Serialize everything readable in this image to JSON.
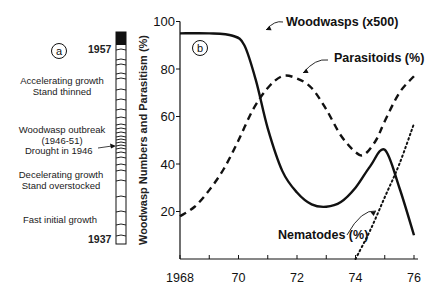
{
  "panel_a": {
    "label": "a",
    "top_year": "1957",
    "bottom_year": "1937",
    "annotations": [
      {
        "line1": "Accelerating growth",
        "line2": "Stand thinned"
      },
      {
        "line1": "Woodwasp outbreak",
        "line2": "(1946-51)"
      },
      {
        "line1": "Drought in 1946",
        "line2": ""
      },
      {
        "line1": "Decelerating growth",
        "line2": "Stand overstocked"
      },
      {
        "line1": "Fast initial growth",
        "line2": ""
      }
    ]
  },
  "panel_b": {
    "label": "b",
    "ylabel": "Woodwasp Numbers and Parasitism (%)",
    "series_labels": {
      "woodwasps": "Woodwasps (x500)",
      "parasitoids": "Parasitoids (%)",
      "nematodes": "Nematodes (%)"
    }
  },
  "chart_data": [
    {
      "type": "diagram",
      "title": "Tree-ring cross section (a)",
      "ylabel": "Year",
      "yticks": [
        "1937",
        "1957"
      ],
      "annotations": [
        "Accelerating growth / Stand thinned",
        "Woodwasp outbreak (1946-51)",
        "Drought in 1946",
        "Decelerating growth / Stand overstocked",
        "Fast initial growth"
      ]
    },
    {
      "type": "line",
      "title": "",
      "xlabel": "",
      "ylabel": "Woodwasp Numbers and Parasitism (%)",
      "xlim": [
        1968,
        76
      ],
      "ylim": [
        0,
        100
      ],
      "xticks": [
        "1968",
        "70",
        "72",
        "74",
        "76"
      ],
      "yticks": [
        20,
        40,
        60,
        80,
        100
      ],
      "grid": false,
      "legend": "inline annotations",
      "series": [
        {
          "name": "Woodwasps (x500)",
          "style": "solid",
          "x": [
            1968,
            1969,
            1969.8,
            1970.2,
            1970.6,
            1971.0,
            1971.5,
            1972.0,
            1972.5,
            1973.0,
            1973.5,
            1974.0,
            1974.5,
            1975.0,
            1975.5,
            1976.0
          ],
          "values": [
            95,
            95,
            94,
            90,
            75,
            55,
            37,
            28,
            23,
            22,
            24,
            30,
            39,
            46,
            30,
            10
          ]
        },
        {
          "name": "Parasitoids (%)",
          "style": "dashed",
          "x": [
            1968,
            1968.5,
            1969.0,
            1969.5,
            1970.0,
            1970.5,
            1971.0,
            1971.5,
            1972.0,
            1972.5,
            1973.0,
            1973.5,
            1974.0,
            1974.3,
            1974.7,
            1975.0,
            1975.5,
            1976.0
          ],
          "values": [
            18,
            22,
            29,
            38,
            50,
            63,
            72,
            77,
            76,
            72,
            63,
            52,
            45,
            44,
            50,
            58,
            70,
            77
          ]
        },
        {
          "name": "Nematodes (%)",
          "style": "dotted",
          "x": [
            1974.0,
            1974.5,
            1975.0,
            1975.5,
            1976.0
          ],
          "values": [
            0,
            12,
            26,
            40,
            57
          ]
        }
      ]
    }
  ]
}
